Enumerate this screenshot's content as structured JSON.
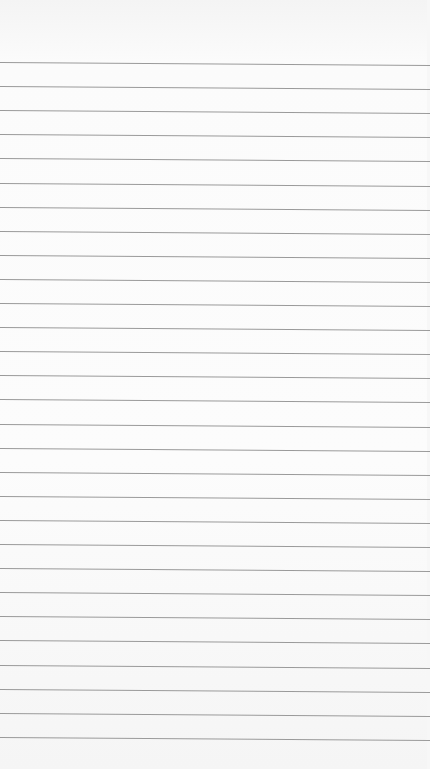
{
  "paper": {
    "background": "#fbfbfb",
    "line_color": "#9a9a9a",
    "first_line_y": 62,
    "line_spacing": 24.1,
    "line_count": 29,
    "line_tilt_px": 3
  }
}
